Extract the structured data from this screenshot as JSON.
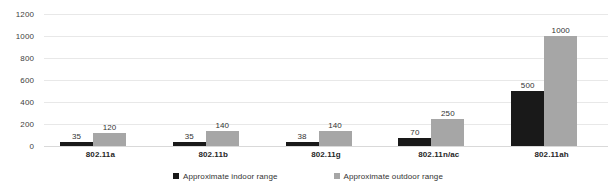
{
  "chart_data": {
    "type": "bar",
    "title": "",
    "subtitle": "",
    "xlabel": "",
    "ylabel": "",
    "categories": [
      "802.11a",
      "802.11b",
      "802.11g",
      "802.11n/ac",
      "802.11ah"
    ],
    "series": [
      {
        "name": "Approximate indoor range",
        "color": "#191919",
        "values": [
          35,
          35,
          38,
          70,
          500
        ]
      },
      {
        "name": "Approximate outdoor range",
        "color": "#a6a6a6",
        "values": [
          120,
          140,
          140,
          250,
          1000
        ]
      }
    ],
    "ylim": [
      0,
      1200
    ],
    "yticks": [
      0,
      200,
      400,
      600,
      800,
      1000,
      1200
    ],
    "ytick_labels": [
      "0",
      "200",
      "400",
      "600",
      "800",
      "1000",
      "1200"
    ],
    "grid": true,
    "data_labels": true,
    "legend_position": "bottom"
  },
  "legend": {
    "items": [
      {
        "label": "Approximate indoor range",
        "swatch": "indoor-swatch-icon"
      },
      {
        "label": "Approximate outdoor range",
        "swatch": "outdoor-swatch-icon"
      }
    ]
  }
}
